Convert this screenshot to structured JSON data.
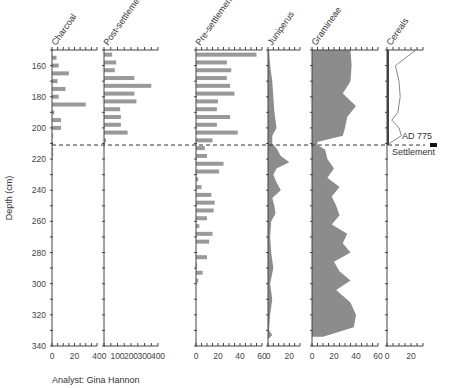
{
  "chart_data": {
    "type": "stratigraphic-diagram",
    "title": "",
    "ylabel": "Depth (cm)",
    "ylim": [
      150,
      340
    ],
    "y_ticks": [
      160,
      180,
      200,
      220,
      240,
      260,
      280,
      300,
      320,
      340
    ],
    "annotation": {
      "label_date": "AD 775",
      "label_event": "Settlement",
      "depth": 211
    },
    "credit": "Analyst: Gina Hannon",
    "panels": [
      {
        "name": "Charcoal",
        "type": "bar",
        "xlim": [
          0,
          40
        ],
        "x_ticks": [
          0,
          20,
          40
        ],
        "depths": [
          155,
          160,
          165,
          170,
          175,
          180,
          185,
          190,
          195,
          200,
          205,
          210,
          214,
          217
        ],
        "values": [
          4,
          6,
          15,
          5,
          12,
          6,
          30,
          2,
          8,
          8,
          1,
          1,
          1,
          1
        ]
      },
      {
        "name": "Post-settlement plants",
        "type": "bar",
        "xlim": [
          0,
          400
        ],
        "x_ticks": [
          0,
          100,
          200,
          300,
          400
        ],
        "depths": [
          153,
          158,
          163,
          168,
          173,
          178,
          183,
          188,
          193,
          198,
          203,
          208
        ],
        "values": [
          60,
          90,
          80,
          225,
          350,
          225,
          240,
          120,
          125,
          125,
          175,
          15
        ]
      },
      {
        "name": "Pre-settlement plants",
        "type": "bar",
        "xlim": [
          0,
          60
        ],
        "x_ticks": [
          0,
          20,
          40,
          60
        ],
        "depths": [
          153,
          158,
          163,
          168,
          173,
          178,
          183,
          188,
          193,
          198,
          203,
          208,
          213,
          218,
          223,
          228,
          233,
          238,
          243,
          248,
          253,
          258,
          263,
          268,
          273,
          278,
          283,
          288,
          293,
          298
        ],
        "values": [
          55,
          28,
          32,
          28,
          31,
          35,
          20,
          19,
          31,
          19,
          38,
          15,
          8,
          10,
          25,
          21,
          2,
          5,
          14,
          17,
          16,
          10,
          3,
          15,
          12,
          0,
          10,
          1,
          6,
          2
        ]
      },
      {
        "name": "Juniperus",
        "type": "area",
        "xlim": [
          0,
          30
        ],
        "x_ticks": [
          0,
          20
        ],
        "depths": [
          150,
          160,
          170,
          180,
          190,
          200,
          205,
          210,
          213,
          218,
          222,
          226,
          230,
          235,
          240,
          245,
          250,
          255,
          260,
          270,
          280,
          290,
          300,
          310,
          320,
          330,
          333,
          335
        ],
        "values": [
          1,
          2,
          4,
          5,
          6,
          8,
          4,
          4,
          8,
          12,
          20,
          8,
          5,
          8,
          12,
          4,
          6,
          7,
          3,
          2,
          3,
          5,
          2,
          4,
          2,
          1,
          4,
          1
        ]
      },
      {
        "name": "Gramineae",
        "type": "area",
        "xlim": [
          0,
          60
        ],
        "x_ticks": [
          0,
          20,
          40,
          60
        ],
        "depths": [
          150,
          160,
          170,
          178,
          186,
          193,
          200,
          205,
          209,
          211,
          214,
          220,
          226,
          232,
          238,
          244,
          250,
          256,
          262,
          268,
          274,
          280,
          286,
          292,
          298,
          304,
          312,
          320,
          328,
          334
        ],
        "values": [
          35,
          36,
          35,
          28,
          40,
          32,
          30,
          28,
          5,
          5,
          12,
          14,
          20,
          14,
          25,
          18,
          22,
          25,
          18,
          32,
          28,
          35,
          20,
          25,
          35,
          22,
          35,
          40,
          38,
          10
        ]
      },
      {
        "name": "Cereals",
        "type": "line",
        "xlim": [
          0,
          30
        ],
        "x_ticks": [
          0,
          20
        ],
        "depths": [
          150,
          160,
          170,
          180,
          190,
          195,
          200,
          205,
          209,
          211
        ],
        "values": [
          24,
          7,
          10,
          11,
          9,
          4,
          10,
          12,
          4,
          0
        ]
      }
    ]
  }
}
